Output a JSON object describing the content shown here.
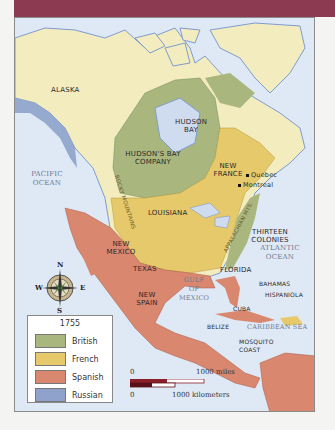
{
  "title_bar": {
    "color": "#8c3a52"
  },
  "map": {
    "regions": [
      {
        "id": "alaska",
        "label": "ALASKA"
      },
      {
        "id": "hudson-bay",
        "label": "HUDSON BAY"
      },
      {
        "id": "hudsons-bay-company",
        "label": "HUDSON'S BAY COMPANY"
      },
      {
        "id": "new-france",
        "label": "NEW FRANCE"
      },
      {
        "id": "louisiana",
        "label": "LOUISIANA"
      },
      {
        "id": "thirteen-colonies",
        "label": "THIRTEEN COLONIES"
      },
      {
        "id": "new-mexico",
        "label": "NEW MEXICO"
      },
      {
        "id": "texas",
        "label": "TEXAS"
      },
      {
        "id": "florida",
        "label": "FLORIDA"
      },
      {
        "id": "new-spain",
        "label": "NEW SPAIN"
      },
      {
        "id": "bahamas",
        "label": "BAHAMAS"
      },
      {
        "id": "hispaniola",
        "label": "HISPANIOLA"
      },
      {
        "id": "cuba",
        "label": "CUBA"
      },
      {
        "id": "belize",
        "label": "BELIZE"
      },
      {
        "id": "mosquito-coast",
        "label": "MOSQUITO COAST"
      }
    ],
    "water": [
      {
        "id": "pacific",
        "label": "PACIFIC OCEAN"
      },
      {
        "id": "atlantic",
        "label": "ATLANTIC OCEAN"
      },
      {
        "id": "gulf",
        "label": "GULF OF MEXICO"
      },
      {
        "id": "caribbean",
        "label": "CARIBBEAN SEA"
      }
    ],
    "mountains": [
      {
        "id": "rocky",
        "label": "ROCKY MOUNTAINS"
      },
      {
        "id": "appalachian",
        "label": "APPALACHIAN MTS."
      }
    ],
    "cities": [
      {
        "id": "quebec",
        "label": "Quebec"
      },
      {
        "id": "montreal",
        "label": "Montreal"
      }
    ]
  },
  "compass": {
    "n": "N",
    "s": "S",
    "e": "E",
    "w": "W"
  },
  "legend": {
    "year": "1755",
    "items": [
      {
        "label": "British",
        "color": "#a9b77f"
      },
      {
        "label": "French",
        "color": "#e6c96a"
      },
      {
        "label": "Spanish",
        "color": "#d9876f"
      },
      {
        "label": "Russian",
        "color": "#8ea2cb"
      }
    ]
  },
  "scale": {
    "miles_zero": "0",
    "miles_label": "1000 miles",
    "km_zero": "0",
    "km_label": "1000 kilometers"
  },
  "colors": {
    "ocean": "#dfe9f5",
    "unclaimed_land": "#f3ecbf",
    "british": "#a9b77f",
    "french": "#e6c96a",
    "spanish": "#d9876f",
    "russian": "#8ea2cb",
    "water_edge": "#7f9ccf"
  }
}
